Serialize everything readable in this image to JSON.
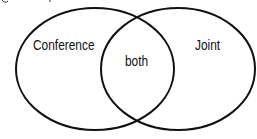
{
  "diagram": {
    "type": "venn",
    "sets": [
      {
        "label": "Conference",
        "cx": 95,
        "cy": 69,
        "rx": 79,
        "ry": 61
      },
      {
        "label": "Joint",
        "cx": 178,
        "cy": 69,
        "rx": 77,
        "ry": 61
      }
    ],
    "intersection_label": "both",
    "stroke_color": "#111111"
  }
}
